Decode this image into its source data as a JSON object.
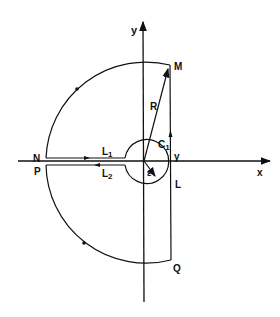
{
  "diagram": {
    "type": "contour-integration",
    "axes": {
      "x_label": "x",
      "y_label": "y"
    },
    "labels": {
      "M": "M",
      "N": "N",
      "P": "P",
      "Q": "Q",
      "R": "R",
      "L1_main": "L",
      "L1_sub": "1",
      "L2_main": "L",
      "L2_sub": "2",
      "C1_main": "C",
      "C1_sub": "1",
      "gamma": "γ",
      "L": "L",
      "epsilon": "ε"
    },
    "stroke_color": "#111111",
    "background": "#ffffff"
  }
}
